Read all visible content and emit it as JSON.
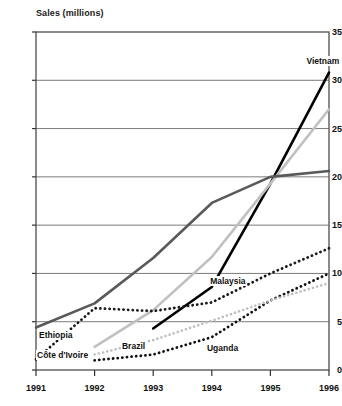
{
  "chart_data": {
    "type": "line",
    "title": "Sales (millions)",
    "xlabel": "",
    "ylabel": "Sales (millions)",
    "x": [
      1991,
      1992,
      1993,
      1994,
      1995,
      1996
    ],
    "xtick_labels": [
      "1991",
      "1992",
      "1993",
      "1994",
      "1995",
      "1996"
    ],
    "ytick_labels": [
      "0",
      "5",
      "10",
      "15",
      "20",
      "25",
      "30",
      "35"
    ],
    "ytick_values": [
      0,
      5,
      10,
      15,
      20,
      25,
      30,
      35
    ],
    "ylim": [
      0,
      35
    ],
    "xlim": [
      1991,
      1996
    ],
    "grid": true,
    "grid_axis": "y",
    "legend": "inline-labels",
    "series": [
      {
        "name": "Vietnam",
        "color": "#000000",
        "style": "solid",
        "width": 2.6,
        "x": [
          1993,
          1994,
          1995,
          1996
        ],
        "values": [
          4.3,
          8.6,
          19.3,
          30.8
        ],
        "label_x": 1995.75,
        "label_y": 32.0
      },
      {
        "name": "Brazil",
        "color": "#c0c0c0",
        "style": "solid",
        "width": 2.6,
        "x": [
          1992,
          1993,
          1994,
          1995,
          1996
        ],
        "values": [
          2.4,
          6.2,
          11.7,
          19.3,
          27.0
        ],
        "label_x": 1992.45,
        "label_y": 2.5
      },
      {
        "name": "Ethiopia",
        "color": "#595959",
        "style": "solid",
        "width": 2.6,
        "x": [
          1991,
          1992,
          1993,
          1994,
          1995,
          1996
        ],
        "values": [
          4.4,
          6.9,
          11.6,
          17.3,
          20.0,
          20.6
        ],
        "label_x": 1991.0,
        "label_y": 3.6
      },
      {
        "name": "Malaysia",
        "color": "#1a1a1a",
        "style": "dotted",
        "width": 2.8,
        "x": [
          1991,
          1992,
          1993,
          1994,
          1995,
          1996
        ],
        "values": [
          1.1,
          6.4,
          6.1,
          7.0,
          10.0,
          12.6
        ],
        "label_x": 1994.15,
        "label_y": 9.2
      },
      {
        "name": "Uganda",
        "color": "#111111",
        "style": "dotted",
        "width": 2.8,
        "x": [
          1992,
          1993,
          1994,
          1995,
          1996
        ],
        "values": [
          1.0,
          1.6,
          3.4,
          7.2,
          10.0
        ],
        "label_x": 1993.9,
        "label_y": 2.3
      },
      {
        "name": "Côte d'Ivoire",
        "color": "#bfbfbf",
        "style": "dotted",
        "width": 2.6,
        "x": [
          1992,
          1993,
          1994,
          1995,
          1996
        ],
        "values": [
          1.6,
          3.1,
          5.1,
          7.2,
          9.0
        ],
        "label_x": 1991.0,
        "label_y": 1.6
      }
    ]
  }
}
